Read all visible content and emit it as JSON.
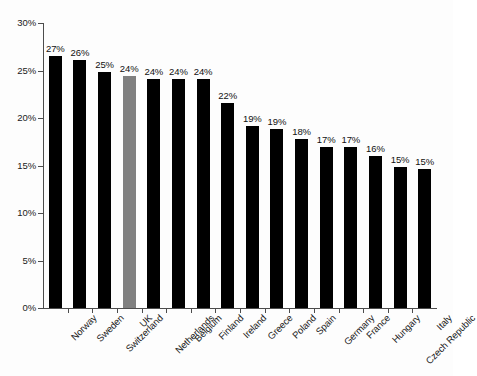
{
  "chart_data": {
    "type": "bar",
    "title": "",
    "subtitle": "",
    "xlabel": "",
    "ylabel": "",
    "ylim": [
      0,
      30
    ],
    "ytick_values": [
      0,
      5,
      10,
      15,
      20,
      25,
      30
    ],
    "ytick_labels": [
      "0%",
      "5%",
      "10%",
      "15%",
      "20%",
      "25%",
      "30%"
    ],
    "grid": false,
    "legend": null,
    "value_label_format": "{v}%",
    "categories": [
      "Norway",
      "Sweden",
      "Switzerland",
      "UK",
      "Netherlands",
      "Belgium",
      "Finland",
      "Ireland",
      "Greece",
      "Poland",
      "Spain",
      "Germany",
      "France",
      "Hungary",
      "Czech Republic",
      "Italy"
    ],
    "values": [
      27,
      26,
      25,
      24,
      24,
      24,
      24,
      22,
      19,
      19,
      18,
      17,
      17,
      16,
      15,
      15
    ],
    "plotted_values": [
      26.5,
      26.1,
      24.8,
      24.4,
      24.1,
      24.1,
      24.1,
      21.6,
      19.2,
      18.8,
      17.8,
      17.0,
      17.0,
      16.0,
      14.8,
      14.6
    ],
    "value_labels": [
      "27%",
      "26%",
      "25%",
      "24%",
      "24%",
      "24%",
      "24%",
      "22%",
      "19%",
      "19%",
      "18%",
      "17%",
      "17%",
      "16%",
      "15%",
      "15%"
    ],
    "highlight_index": 3,
    "colors": {
      "bar": "#000000",
      "bar_highlight": "#808080",
      "axis": "#4c4c4c",
      "text": "#1a1a1a",
      "background": "#fdfdfd"
    }
  }
}
